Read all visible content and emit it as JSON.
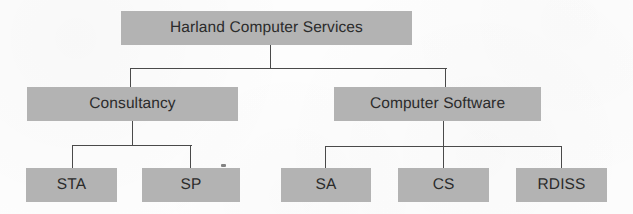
{
  "diagram": {
    "background_color": "#fdfdfd",
    "node_fill_color": "#b3b3b3",
    "node_text_color": "#2b2b2b",
    "connector_color": "#4a4a4a",
    "root": {
      "label": "Harland Computer Services"
    },
    "divisions": [
      {
        "label": "Consultancy"
      },
      {
        "label": "Computer Software"
      }
    ],
    "units": [
      {
        "label": "STA",
        "parent": "Consultancy"
      },
      {
        "label": "SP",
        "parent": "Consultancy"
      },
      {
        "label": "SA",
        "parent": "Computer Software"
      },
      {
        "label": "CS",
        "parent": "Computer Software"
      },
      {
        "label": "RDISS",
        "parent": "Computer Software"
      }
    ]
  }
}
